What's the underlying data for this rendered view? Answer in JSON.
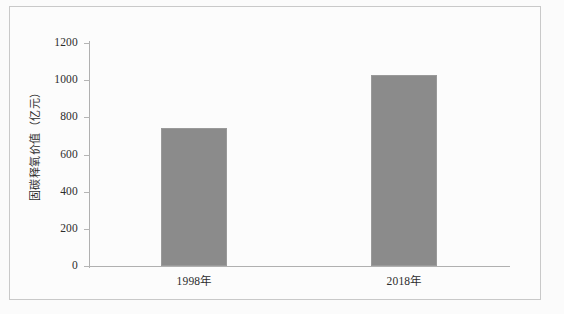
{
  "chart_data": {
    "type": "bar",
    "title": "",
    "categories": [
      "1998年",
      "2018年"
    ],
    "values": [
      743,
      1028
    ],
    "series": [
      {
        "name": "固碳释氧价值",
        "values": [
          743,
          1028
        ]
      }
    ],
    "xlabel": "",
    "ylabel": "固碳释氧价值（亿元）",
    "ylim": [
      0,
      1200
    ],
    "yticks": [
      0,
      200,
      400,
      600,
      800,
      1000,
      1200
    ],
    "ytick_labels": [
      "0",
      "200",
      "400",
      "600",
      "800",
      "1000",
      "1200"
    ],
    "grid": false,
    "legend": false,
    "bar_color": "#8b8b8b",
    "axis_color": "#b0b0b0",
    "text_color": "#2c2c2c",
    "background": "#fcfcfc"
  },
  "figure": {
    "frame_border_color": "#c9c9c9"
  }
}
